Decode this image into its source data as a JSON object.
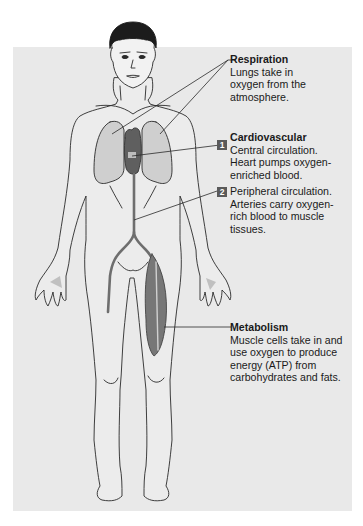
{
  "figure": {
    "colors": {
      "panel_bg": "#e9e9e9",
      "outline": "#2a2a2a",
      "organ_fill": "#c9c9c9",
      "vessel_fill": "#6e6e6e",
      "muscle_fill": "#777777",
      "hair": "#1c1c1c",
      "badge_bg": "#5a5a5a"
    }
  },
  "callouts": [
    {
      "id": "respiration",
      "title": "Respiration",
      "text": [
        "Lungs take in",
        "oxygen from the",
        "atmosphere."
      ]
    },
    {
      "id": "cardiovascular",
      "title": "Cardiovascular",
      "badge": "1",
      "text": [
        "Central circulation.",
        "Heart pumps oxygen-",
        "enriched blood."
      ]
    },
    {
      "id": "peripheral",
      "badge": "2",
      "text": [
        "Peripheral circulation.",
        "Arteries carry oxygen-",
        "rich blood to muscle",
        "tissues."
      ]
    },
    {
      "id": "metabolism",
      "title": "Metabolism",
      "text": [
        "Muscle cells take in and",
        "use oxygen to produce",
        "energy (ATP) from",
        "carbohydrates and fats."
      ]
    }
  ]
}
